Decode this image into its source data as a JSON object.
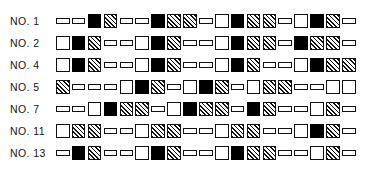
{
  "figure": {
    "name": "sequence-pattern-chart",
    "legend_types": {
      "white": "open-square",
      "black": "filled-square",
      "hatch": "hatched-square",
      "small": "small-open-rectangle"
    }
  },
  "chart_data": {
    "type": "heatmap",
    "title": "",
    "xlabel": "",
    "ylabel": "",
    "categories": [
      "1",
      "2",
      "3",
      "4",
      "5",
      "6",
      "7",
      "8",
      "9",
      "10",
      "11",
      "12",
      "13",
      "14",
      "15",
      "16",
      "17",
      "18",
      "19"
    ],
    "symbol_legend": {
      "white": "open square",
      "black": "filled square",
      "hatch": "hatched square",
      "small": "small open rectangle"
    },
    "series": [
      {
        "name": "NO. 1",
        "values": [
          "small",
          "small",
          "black",
          "hatch",
          "small",
          "small",
          "black",
          "hatch",
          "hatch",
          "small",
          "white",
          "black",
          "hatch",
          "hatch",
          "small",
          "white",
          "black",
          "hatch",
          "small"
        ]
      },
      {
        "name": "NO. 2",
        "values": [
          "white",
          "black",
          "hatch",
          "small",
          "small",
          "white",
          "black",
          "hatch",
          "small",
          "small",
          "white",
          "black",
          "hatch",
          "hatch",
          "small",
          "black",
          "hatch",
          "hatch",
          "small"
        ]
      },
      {
        "name": "NO. 4",
        "values": [
          "white",
          "black",
          "hatch",
          "small",
          "small",
          "white",
          "black",
          "hatch",
          "small",
          "small",
          "white",
          "black",
          "hatch",
          "small",
          "small",
          "white",
          "black",
          "hatch",
          "hatch"
        ]
      },
      {
        "name": "NO. 5",
        "values": [
          "hatch",
          "small",
          "small",
          "small",
          "white",
          "black",
          "hatch",
          "small",
          "white",
          "black",
          "hatch",
          "small",
          "white",
          "hatch",
          "hatch",
          "small",
          "small",
          "white",
          "white"
        ]
      },
      {
        "name": "NO. 7",
        "values": [
          "small",
          "small",
          "white",
          "black",
          "hatch",
          "hatch",
          "small",
          "white",
          "black",
          "hatch",
          "hatch",
          "small",
          "black",
          "hatch",
          "small",
          "small",
          "white",
          "hatch",
          "small"
        ]
      },
      {
        "name": "NO. 11",
        "values": [
          "white",
          "hatch",
          "hatch",
          "small",
          "small",
          "white",
          "hatch",
          "hatch",
          "small",
          "small",
          "white",
          "hatch",
          "hatch",
          "small",
          "small",
          "white",
          "black",
          "hatch",
          "small"
        ]
      },
      {
        "name": "NO. 13",
        "values": [
          "small",
          "black",
          "hatch",
          "small",
          "small",
          "white",
          "black",
          "hatch",
          "small",
          "small",
          "white",
          "black",
          "hatch",
          "hatch",
          "small",
          "small",
          "white",
          "hatch",
          "small"
        ]
      }
    ]
  },
  "rows": [
    {
      "label": "NO. 1"
    },
    {
      "label": "NO. 2"
    },
    {
      "label": "NO. 4"
    },
    {
      "label": "NO. 5"
    },
    {
      "label": "NO. 7"
    },
    {
      "label": "NO. 11"
    },
    {
      "label": "NO. 13"
    }
  ],
  "colors": {
    "ink": "#111111",
    "fill_black": "#000000",
    "background": "#ffffff"
  }
}
